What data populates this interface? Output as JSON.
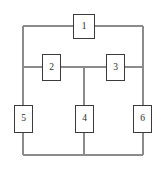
{
  "diagram": {
    "type": "block-network-diagram",
    "canvas": {
      "width": 166,
      "height": 174,
      "background": "#ffffff"
    },
    "style": {
      "wire_color": "#8b8b8b",
      "box_border_color": "#3b3b3b",
      "box_fill": "#ffffff",
      "label_color": "#2b2b2b"
    },
    "nodes": [
      {
        "id": "1",
        "label": "1",
        "x": 73,
        "y": 14,
        "width": 22,
        "height": 25
      },
      {
        "id": "2",
        "label": "2",
        "x": 42,
        "y": 54,
        "width": 19,
        "height": 27
      },
      {
        "id": "3",
        "label": "3",
        "x": 106,
        "y": 54,
        "width": 19,
        "height": 27
      },
      {
        "id": "4",
        "label": "4",
        "x": 75,
        "y": 105,
        "width": 19,
        "height": 28
      },
      {
        "id": "5",
        "label": "5",
        "x": 14,
        "y": 105,
        "width": 19,
        "height": 28
      },
      {
        "id": "6",
        "label": "6",
        "x": 133,
        "y": 105,
        "width": 19,
        "height": 28
      }
    ],
    "rails": {
      "left_x": 23,
      "right_x": 143,
      "middle_x": 84,
      "top_y": 26,
      "mid_y": 67,
      "bottom_y": 155
    },
    "edges": [
      {
        "from": "left-rail",
        "to": "1",
        "path": "M 23,26 L 73,26"
      },
      {
        "from": "1",
        "to": "right-rail",
        "path": "M 95,26 L 143,26"
      },
      {
        "from": "left-rail",
        "to": "2",
        "path": "M 23,67 L 42,67"
      },
      {
        "from": "2",
        "to": "middle-junction",
        "path": "M 61,67 L 84,67"
      },
      {
        "from": "middle-junction",
        "to": "3",
        "path": "M 84,67 L 106,67"
      },
      {
        "from": "3",
        "to": "right-rail",
        "path": "M 125,67 L 143,67"
      },
      {
        "from": "middle-junction",
        "to": "4",
        "path": "M 84,67 L 84,105"
      },
      {
        "from": "4",
        "to": "bottom-rail",
        "path": "M 84,133 L 84,155"
      },
      {
        "from": "left-rail-top",
        "to": "5",
        "path": "M 23,26 L 23,105"
      },
      {
        "from": "5",
        "to": "bottom-rail-left",
        "path": "M 23,133 L 23,155"
      },
      {
        "from": "right-rail-top",
        "to": "6",
        "path": "M 143,26 L 143,105"
      },
      {
        "from": "6",
        "to": "bottom-rail-right",
        "path": "M 143,133 L 143,155"
      },
      {
        "from": "bottom-rail-left",
        "to": "bottom-rail-right",
        "path": "M 23,155 L 143,155"
      }
    ]
  }
}
